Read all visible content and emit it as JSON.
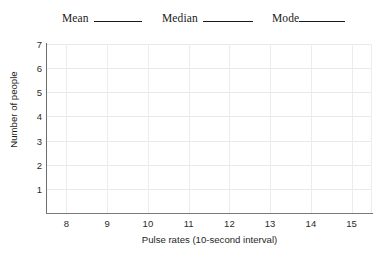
{
  "header": {
    "stats": [
      {
        "label": "Mean",
        "blank": true
      },
      {
        "label": "Median",
        "blank": true
      },
      {
        "label": "Mode",
        "blank": true
      }
    ]
  },
  "chart_data": {
    "type": "bar",
    "title": "",
    "xlabel": "Pulse rates (10-second interval)",
    "ylabel": "Number of people",
    "categories": [
      "8",
      "9",
      "10",
      "11",
      "12",
      "13",
      "14",
      "15"
    ],
    "values": [
      0,
      0,
      0,
      0,
      0,
      0,
      0,
      0
    ],
    "xticks": [
      "8",
      "9",
      "10",
      "11",
      "12",
      "13",
      "14",
      "15"
    ],
    "yticks": [
      "1",
      "2",
      "3",
      "4",
      "5",
      "6",
      "7"
    ],
    "xlim": [
      7.5,
      15.5
    ],
    "ylim": [
      0,
      7
    ],
    "grid": true,
    "legend": false,
    "note": "empty worksheet grid - no data plotted"
  },
  "colors": {
    "grid": "#e9e9e9",
    "axis": "#6e6e6e",
    "text": "#1f1f1f",
    "background": "#ffffff"
  }
}
